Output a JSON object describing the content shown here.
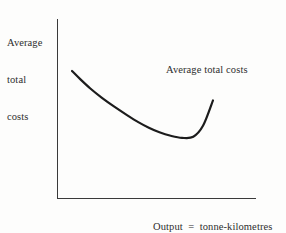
{
  "figure": {
    "title": "",
    "background_color": "#fdfdfc",
    "ink_color": "#2b2b2b"
  },
  "axes": {
    "y_label_lines": [
      "Average",
      "total",
      "costs"
    ],
    "x_label_lines": [
      "Output  =  tonne-kilometres",
      "transported"
    ],
    "x_axis_color": "#3a3a3a",
    "y_axis_color": "#3a3a3a"
  },
  "annotations": {
    "curve_label": "Average total costs"
  },
  "chart_data": {
    "type": "line",
    "title": "",
    "xlabel": "Output = tonne-kilometres transported",
    "ylabel": "Average total costs",
    "grid": false,
    "legend": "inline-annotation",
    "legend_position": "upper-right",
    "xlim": [
      0,
      1
    ],
    "ylim": [
      0,
      1
    ],
    "axis_ticks": {
      "x": [],
      "y": []
    },
    "series": [
      {
        "name": "Average total costs",
        "shape": "u-shaped-convex",
        "stroke_color": "#1c1c1c",
        "stroke_width": 2.2,
        "x": [
          0.0,
          0.06,
          0.13,
          0.21,
          0.3,
          0.39,
          0.47,
          0.545,
          0.62,
          0.7,
          0.78,
          0.86,
          0.93,
          1.0
        ],
        "y": [
          1.0,
          0.88,
          0.75,
          0.62,
          0.49,
          0.37,
          0.27,
          0.19,
          0.125,
          0.075,
          0.045,
          0.06,
          0.22,
          0.58
        ],
        "minimum_point": {
          "x": 0.62,
          "y": 0.045
        },
        "left_endpoint": {
          "x": 0.0,
          "y": 1.0
        },
        "right_endpoint": {
          "x": 1.0,
          "y": 0.58
        }
      }
    ]
  }
}
